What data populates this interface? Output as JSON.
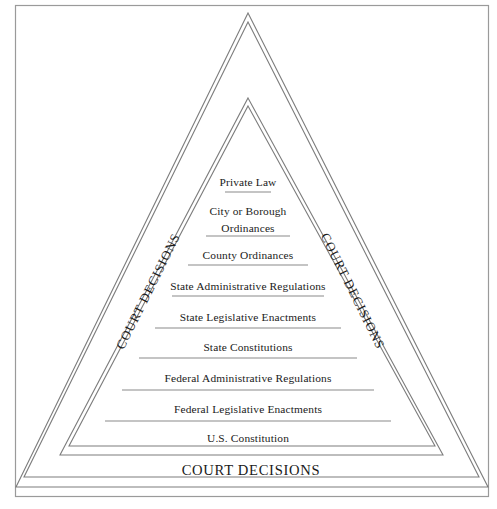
{
  "figure": {
    "type": "hierarchy-pyramid",
    "credit": "© Cengage Learning",
    "base_label": "COURT DECISIONS",
    "left_side_label": "COURT DECISIONS",
    "right_side_label": "COURT DECISIONS",
    "tiers": [
      {
        "index": 1,
        "lines": [
          "Private Law"
        ]
      },
      {
        "index": 2,
        "lines": [
          "City or Borough",
          "Ordinances"
        ]
      },
      {
        "index": 3,
        "lines": [
          "County Ordinances"
        ]
      },
      {
        "index": 4,
        "lines": [
          "State Administrative Regulations"
        ]
      },
      {
        "index": 5,
        "lines": [
          "State Legislative Enactments"
        ]
      },
      {
        "index": 6,
        "lines": [
          "State Constitutions"
        ]
      },
      {
        "index": 7,
        "lines": [
          "Federal Administrative Regulations"
        ]
      },
      {
        "index": 8,
        "lines": [
          "Federal Legislative Enactments"
        ]
      },
      {
        "index": 9,
        "lines": [
          "U.S. Constitution"
        ]
      }
    ],
    "colors": {
      "background": "#ffffff",
      "outline": "#7d7d7d",
      "frame": "#9a9a9a",
      "text": "#1a1a1a",
      "credit_text": "#4a4a4a"
    }
  }
}
